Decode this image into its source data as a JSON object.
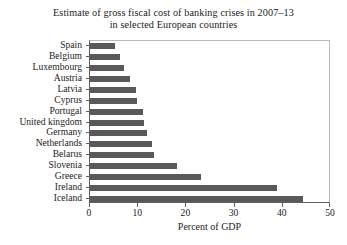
{
  "chart_data": {
    "type": "bar",
    "orientation": "horizontal",
    "title": "Estimate of gross fiscal cost of banking crises in 2007–13 in selected European countries",
    "title_lines": [
      "Estimate of gross fiscal cost of banking crises in 2007–13",
      "in selected European countries"
    ],
    "xlabel": "Percent of GDP",
    "ylabel": "",
    "categories": [
      "Spain",
      "Belgium",
      "Luxembourg",
      "Austria",
      "Latvia",
      "Cyprus",
      "Portugal",
      "United kingdom",
      "Germany",
      "Netherlands",
      "Belarus",
      "Slovenia",
      "Greece",
      "Ireland",
      "Iceland"
    ],
    "values": [
      5.2,
      6.3,
      7.0,
      8.3,
      9.5,
      9.7,
      11.0,
      11.3,
      11.8,
      12.8,
      13.3,
      18.0,
      23.0,
      38.8,
      44.2
    ],
    "xlim": [
      0,
      50
    ],
    "xticks": [
      0,
      10,
      20,
      30,
      40,
      50
    ],
    "xtick_labels": [
      "0",
      "10",
      "20",
      "30",
      "40",
      "50"
    ],
    "grid": false,
    "legend": false,
    "bar_color": "#59595b",
    "axis_color": "#5f5f5f",
    "frame_color": "#b9b9b9",
    "background": "#ffffff"
  }
}
